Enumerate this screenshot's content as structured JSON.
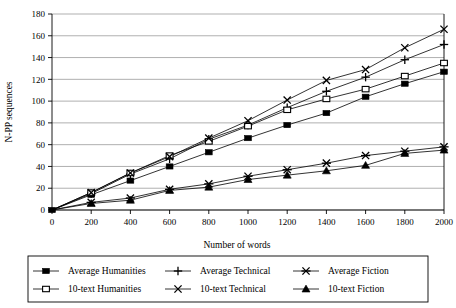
{
  "chart_data": {
    "type": "line",
    "title": "",
    "xlabel": "Number of words",
    "ylabel": "N-PP sequences",
    "x": [
      0,
      200,
      400,
      600,
      800,
      1000,
      1200,
      1400,
      1600,
      1800,
      2000
    ],
    "xlim": [
      0,
      2000
    ],
    "ylim": [
      0,
      180
    ],
    "xticks": [
      "0",
      "200",
      "400",
      "600",
      "800",
      "1000",
      "1200",
      "1400",
      "1600",
      "1800",
      "2000"
    ],
    "yticks": [
      "0",
      "20",
      "40",
      "60",
      "80",
      "100",
      "120",
      "140",
      "160",
      "180"
    ],
    "grid": true,
    "legend_position": "bottom",
    "series": [
      {
        "name": "Average Humanities",
        "marker": "filled-square",
        "values": [
          0,
          14,
          27,
          40,
          53,
          66,
          78,
          89,
          104,
          116,
          127
        ]
      },
      {
        "name": "Average Technical",
        "marker": "plus",
        "values": [
          0,
          15,
          33,
          47,
          65,
          78,
          94,
          109,
          122,
          138,
          152
        ]
      },
      {
        "name": "Average Fiction",
        "marker": "asterisk",
        "values": [
          0,
          7,
          11,
          19,
          24,
          31,
          37,
          43,
          50,
          54,
          58
        ]
      },
      {
        "name": "10-text Humanities",
        "marker": "hollow-square",
        "values": [
          0,
          16,
          34,
          50,
          63,
          77,
          92,
          102,
          111,
          123,
          135
        ]
      },
      {
        "name": "10-text Technical",
        "marker": "cross",
        "values": [
          0,
          16,
          34,
          49,
          66,
          82,
          101,
          119,
          129,
          149,
          166
        ]
      },
      {
        "name": "10-text Fiction",
        "marker": "filled-triangle",
        "values": [
          0,
          6,
          9,
          18,
          21,
          28,
          32,
          36,
          41,
          52,
          55
        ]
      }
    ]
  },
  "legend": {
    "entries": [
      {
        "label": "Average Humanities",
        "marker": "filled-square"
      },
      {
        "label": "Average Technical",
        "marker": "plus"
      },
      {
        "label": "Average Fiction",
        "marker": "asterisk"
      },
      {
        "label": "10-text Humanities",
        "marker": "hollow-square"
      },
      {
        "label": "10-text Technical",
        "marker": "cross"
      },
      {
        "label": "10-text Fiction",
        "marker": "filled-triangle"
      }
    ]
  }
}
